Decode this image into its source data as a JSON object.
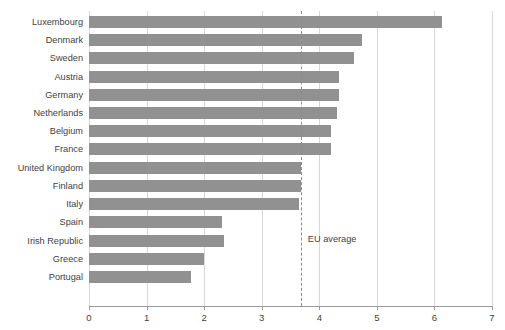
{
  "chart_data": {
    "type": "bar",
    "orientation": "horizontal",
    "title": "",
    "subtitle": "",
    "xlabel": "",
    "ylabel": "",
    "xlim": [
      0,
      7
    ],
    "xticks": [
      "0",
      "1",
      "2",
      "3",
      "4",
      "5",
      "6",
      "7"
    ],
    "grid": "vertical",
    "legend": "none",
    "bar_color": "#919191",
    "categories": [
      "Luxembourg",
      "Denmark",
      "Sweden",
      "Austria",
      "Germany",
      "Netherlands",
      "Belgium",
      "France",
      "United Kingdom",
      "Finland",
      "Italy",
      "Spain",
      "Irish Republic",
      "Greece",
      "Portugal"
    ],
    "values": [
      6.13,
      4.74,
      4.6,
      4.35,
      4.35,
      4.3,
      4.2,
      4.2,
      3.68,
      3.68,
      3.65,
      2.31,
      2.34,
      2.0,
      1.77
    ],
    "annotations": [
      {
        "name": "eu-average",
        "label": "EU average",
        "value": 3.68,
        "style": "dashed-vertical-line",
        "color": "#8c8c8c"
      }
    ]
  }
}
